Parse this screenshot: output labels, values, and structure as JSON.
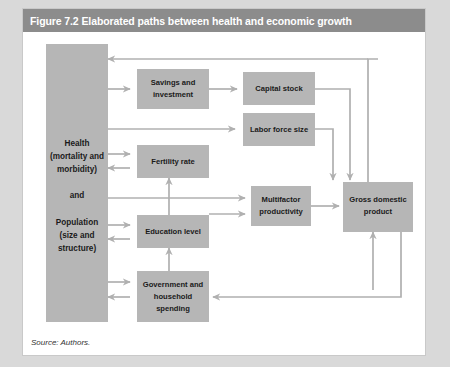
{
  "figure": {
    "title": "Figure 7.2 Elaborated paths between health and economic growth",
    "source_note": "Source: Authors.",
    "colors": {
      "title_bar": "#8c8c8c",
      "title_text": "#ffffff",
      "node_fill": "#b6b6b6",
      "arrow": "#b0b0b0",
      "panel": "#ffffff",
      "page": "#d9d9d9"
    }
  },
  "nodes": {
    "driver": {
      "lines": [
        "Health",
        "(mortality and",
        "morbidity)",
        "",
        "and",
        "",
        "Population",
        "(size and",
        "structure)"
      ]
    },
    "savings": {
      "lines": [
        "Savings and",
        "investment"
      ]
    },
    "capital_stock": {
      "lines": [
        "Capital stock"
      ]
    },
    "labor_force": {
      "lines": [
        "Labor  force size"
      ]
    },
    "fertility": {
      "lines": [
        "Fertility rate"
      ]
    },
    "education": {
      "lines": [
        "Education level"
      ]
    },
    "government": {
      "lines": [
        "Government and",
        "household",
        "spending"
      ]
    },
    "multifactor": {
      "lines": [
        "Multifactor",
        "productivity"
      ]
    },
    "gdp": {
      "lines": [
        "Gross domestic",
        "product"
      ]
    }
  },
  "edges": [
    {
      "from": "driver",
      "to": "savings",
      "kind": "arrow"
    },
    {
      "from": "savings",
      "to": "capital_stock",
      "kind": "arrow"
    },
    {
      "from": "driver",
      "to": "labor_force",
      "kind": "arrow"
    },
    {
      "from": "driver",
      "to": "fertility",
      "kind": "arrow"
    },
    {
      "from": "fertility",
      "to": "driver",
      "kind": "arrow"
    },
    {
      "from": "driver",
      "to": "education",
      "kind": "arrow"
    },
    {
      "from": "education",
      "to": "driver",
      "kind": "arrow"
    },
    {
      "from": "driver",
      "to": "government",
      "kind": "arrow"
    },
    {
      "from": "government",
      "to": "driver",
      "kind": "arrow"
    },
    {
      "from": "driver",
      "to": "multifactor",
      "kind": "arrow"
    },
    {
      "from": "education",
      "to": "multifactor",
      "kind": "arrow"
    },
    {
      "from": "education",
      "to": "fertility",
      "kind": "arrow"
    },
    {
      "from": "government",
      "to": "education",
      "kind": "arrow"
    },
    {
      "from": "capital_stock",
      "to": "gdp",
      "kind": "arrow"
    },
    {
      "from": "labor_force",
      "to": "gdp",
      "kind": "arrow"
    },
    {
      "from": "multifactor",
      "to": "gdp",
      "kind": "arrow"
    },
    {
      "from": "gdp",
      "to": "driver",
      "kind": "arrow"
    },
    {
      "from": "gdp",
      "to": "government",
      "kind": "arrow"
    },
    {
      "from": "government",
      "to": "gdp",
      "kind": "arrow"
    }
  ]
}
